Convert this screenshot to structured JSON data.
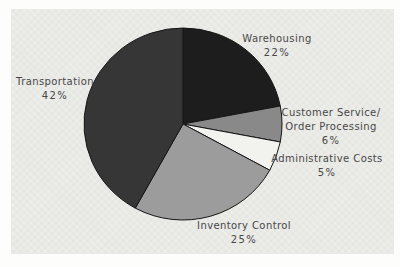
{
  "page": {
    "background_color": "#fdfdfb",
    "panel_color": "#e9e9e5"
  },
  "chart_data": {
    "type": "pie",
    "start_angle_deg_from_north": 0,
    "direction": "clockwise",
    "legend": "none",
    "labels_outside": true,
    "outline_color": "#161616",
    "text_color": "#484848",
    "segments": [
      {
        "label_lines": [
          "Warehousing"
        ],
        "value": 22,
        "pct_label": "22%",
        "color": "#1d1d1d"
      },
      {
        "label_lines": [
          "Customer Service/",
          "Order Processing"
        ],
        "value": 6,
        "pct_label": "6%",
        "color": "#898989"
      },
      {
        "label_lines": [
          "Administrative Costs"
        ],
        "value": 5,
        "pct_label": "5%",
        "color": "#f2f2ee"
      },
      {
        "label_lines": [
          "Inventory Control"
        ],
        "value": 25,
        "pct_label": "25%",
        "color": "#9c9c9c"
      },
      {
        "label_lines": [
          "Transportation"
        ],
        "value": 42,
        "pct_label": "42%",
        "color": "#363636"
      }
    ]
  }
}
